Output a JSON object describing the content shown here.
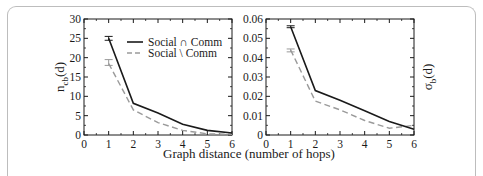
{
  "chart_data": [
    {
      "type": "line",
      "title": "",
      "xlabel": "Graph distance (number of hops)",
      "ylabel": "n_cb(d)",
      "ylabel_main": "n",
      "ylabel_sub": "cb",
      "ylabel_tail": "(d)",
      "xlim": [
        0,
        6
      ],
      "ylim": [
        0,
        30
      ],
      "x_ticks": [
        "0",
        "1",
        "2",
        "3",
        "4",
        "5",
        "6"
      ],
      "y_ticks": [
        "0",
        "5",
        "10",
        "15",
        "20",
        "25",
        "30"
      ],
      "x": [
        1,
        2,
        3,
        4,
        5,
        6
      ],
      "series": [
        {
          "name": "Social ∩ Comm",
          "style": "solid",
          "color": "#1a1a1a",
          "values": [
            25.0,
            8.2,
            5.7,
            2.8,
            1.2,
            0.5
          ],
          "error_at_x1": [
            24.5,
            25.5
          ]
        },
        {
          "name": "Social \\ Comm",
          "style": "dashed",
          "color": "#9a9a9a",
          "values": [
            18.5,
            6.5,
            3.2,
            1.2,
            0.3,
            0.2
          ],
          "error_at_x1": [
            18.0,
            19.5
          ]
        }
      ],
      "legend_position": "upper right",
      "grid": false
    },
    {
      "type": "line",
      "title": "",
      "xlabel": "Graph distance (number of hops)",
      "ylabel": "σ_b(d)",
      "ylabel_main": "σ",
      "ylabel_sub": "b",
      "ylabel_tail": "(d)",
      "xlim": [
        0,
        6
      ],
      "ylim": [
        0,
        0.06
      ],
      "x_ticks": [
        "0",
        "1",
        "2",
        "3",
        "4",
        "5",
        "6"
      ],
      "y_ticks": [
        "0",
        "0.01",
        "0.02",
        "0.03",
        "0.04",
        "0.05",
        "0.06"
      ],
      "x": [
        1,
        2,
        3,
        4,
        5,
        6
      ],
      "series": [
        {
          "name": "Social ∩ Comm",
          "style": "solid",
          "color": "#1a1a1a",
          "values": [
            0.056,
            0.023,
            0.018,
            0.0125,
            0.007,
            0.003
          ],
          "error_at_x1": [
            0.0555,
            0.0565
          ]
        },
        {
          "name": "Social \\ Comm",
          "style": "dashed",
          "color": "#9a9a9a",
          "values": [
            0.044,
            0.0175,
            0.013,
            0.0075,
            0.0035,
            0.005
          ],
          "error_at_x1": [
            0.043,
            0.0445
          ]
        }
      ],
      "grid": false
    }
  ],
  "shared_xlabel": "Graph distance (number of hops)",
  "legend": {
    "items": [
      {
        "label": "Social ∩ Comm",
        "style": "solid"
      },
      {
        "label": "Social \\ Comm",
        "style": "dashed"
      }
    ]
  }
}
